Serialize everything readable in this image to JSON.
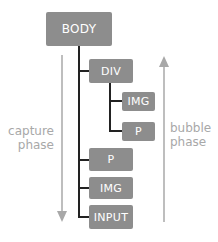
{
  "diagram": {
    "nodes": {
      "body": "BODY",
      "div": "DIV",
      "div_img": "IMG",
      "div_p": "P",
      "p": "P",
      "img": "IMG",
      "input": "INPUT"
    },
    "labels": {
      "capture_line1": "capture",
      "capture_line2": "phase",
      "bubble_line1": "bubble",
      "bubble_line2": "phase"
    },
    "colors": {
      "node_fill": "#8d8d8d",
      "node_text": "#ffffff",
      "connector": "#222222",
      "arrow": "#a8a8a8",
      "label_text": "#a8a8a8"
    },
    "edges": [
      [
        "BODY",
        "DIV"
      ],
      [
        "BODY",
        "P"
      ],
      [
        "BODY",
        "IMG"
      ],
      [
        "BODY",
        "INPUT"
      ],
      [
        "DIV",
        "IMG"
      ],
      [
        "DIV",
        "P"
      ]
    ],
    "arrows": [
      {
        "name": "capture phase",
        "direction": "down"
      },
      {
        "name": "bubble phase",
        "direction": "up"
      }
    ]
  }
}
